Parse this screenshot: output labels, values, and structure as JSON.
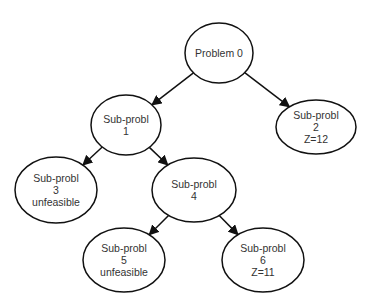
{
  "diagram": {
    "type": "branch-and-bound tree",
    "nodes": [
      {
        "id": "n0",
        "lines": [
          "Problem 0"
        ],
        "cx": 219,
        "cy": 53,
        "rx": 34,
        "ry": 30
      },
      {
        "id": "n1",
        "lines": [
          "Sub-probl",
          "1"
        ],
        "cx": 126,
        "cy": 125,
        "rx": 35,
        "ry": 30
      },
      {
        "id": "n2",
        "lines": [
          "Sub-probl",
          "2",
          "Z=12"
        ],
        "cx": 316,
        "cy": 127,
        "rx": 40,
        "ry": 27
      },
      {
        "id": "n3",
        "lines": [
          "Sub-probl",
          "3",
          "unfeasible"
        ],
        "cx": 56,
        "cy": 190,
        "rx": 41,
        "ry": 33
      },
      {
        "id": "n4",
        "lines": [
          "Sub-probl",
          "4"
        ],
        "cx": 194,
        "cy": 190,
        "rx": 42,
        "ry": 32
      },
      {
        "id": "n5",
        "lines": [
          "Sub-probl",
          "5",
          "unfeasible"
        ],
        "cx": 124,
        "cy": 260,
        "rx": 41,
        "ry": 32
      },
      {
        "id": "n6",
        "lines": [
          "Sub-probl",
          "6",
          "Z=11"
        ],
        "cx": 263,
        "cy": 260,
        "rx": 41,
        "ry": 32
      }
    ],
    "edges": [
      {
        "from": "n0",
        "to": "n1"
      },
      {
        "from": "n0",
        "to": "n2"
      },
      {
        "from": "n1",
        "to": "n3"
      },
      {
        "from": "n1",
        "to": "n4"
      },
      {
        "from": "n4",
        "to": "n5"
      },
      {
        "from": "n4",
        "to": "n6"
      }
    ],
    "colors": {
      "stroke": "#111111",
      "text": "#333333",
      "background": "#ffffff"
    }
  }
}
